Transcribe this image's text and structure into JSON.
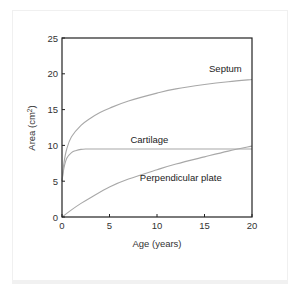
{
  "chart_data": {
    "type": "line",
    "title": "",
    "xlabel": "Age (years)",
    "ylabel": "Area (cm²)",
    "ylabel_parts": {
      "main": "Area (cm",
      "sup": "2",
      "close": ")"
    },
    "xlim": [
      0,
      20
    ],
    "ylim": [
      0,
      25
    ],
    "xticks": [
      0,
      5,
      10,
      15,
      20
    ],
    "yticks": [
      0,
      5,
      10,
      15,
      20,
      25
    ],
    "grid": false,
    "legend": "inline labels",
    "line_color": "#a8a8a8",
    "series": [
      {
        "name": "Septum",
        "x": [
          0,
          0.2,
          0.5,
          1,
          2,
          3,
          4,
          5,
          7,
          10,
          12,
          15,
          17.5,
          20
        ],
        "values": [
          5,
          7.5,
          9.5,
          11.2,
          12.8,
          13.8,
          14.6,
          15.2,
          16.2,
          17.3,
          17.9,
          18.5,
          18.9,
          19.2
        ]
      },
      {
        "name": "Cartilage",
        "x": [
          0,
          0.2,
          0.5,
          1,
          1.5,
          2,
          2.5,
          3,
          5,
          10,
          15,
          20
        ],
        "values": [
          5,
          6.8,
          8.2,
          9.0,
          9.3,
          9.45,
          9.5,
          9.5,
          9.5,
          9.5,
          9.5,
          9.5
        ]
      },
      {
        "name": "Perpendicular plate",
        "x": [
          0,
          1,
          2,
          3,
          5,
          7,
          10,
          12,
          15,
          17.5,
          20
        ],
        "values": [
          0,
          1.0,
          1.9,
          2.7,
          4.2,
          5.3,
          6.6,
          7.4,
          8.4,
          9.2,
          9.9
        ]
      }
    ],
    "annotations": [
      {
        "text": "Septum",
        "x": 17.2,
        "y": 20.2
      },
      {
        "text": "Cartilage",
        "x": 9.2,
        "y": 10.3
      },
      {
        "text": "Perpendicular plate",
        "x": 12.5,
        "y": 5.0
      }
    ]
  }
}
